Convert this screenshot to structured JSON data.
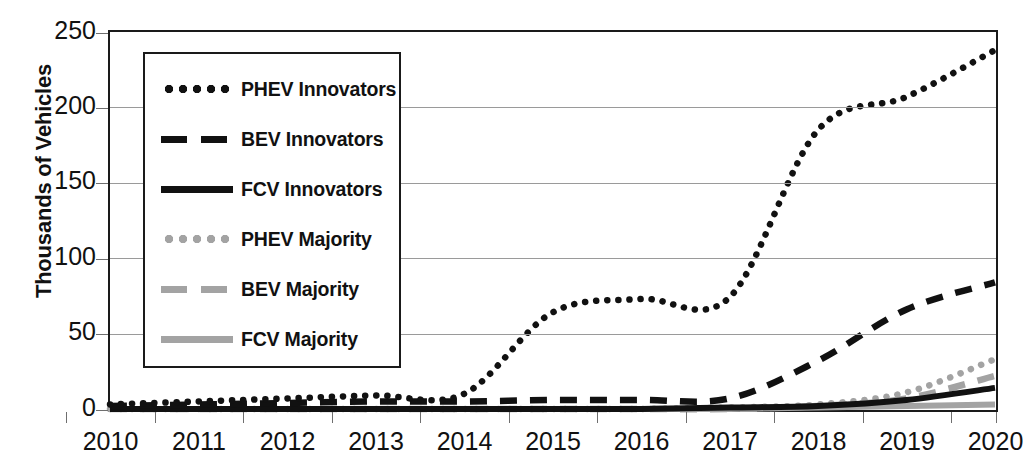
{
  "chart_data": {
    "type": "line",
    "title": "",
    "xlabel": "",
    "ylabel": "Thousands of Vehicles",
    "xlim": [
      2009.5,
      2020.5
    ],
    "ylim": [
      0,
      250
    ],
    "yticks": [
      0,
      50,
      100,
      150,
      200,
      250
    ],
    "grid": "horizontal",
    "legend_position": "upper-left-inside",
    "categories": [
      "2010",
      "2011",
      "2012",
      "2013",
      "2014",
      "2015",
      "2016",
      "2017",
      "2018",
      "2019",
      "2020"
    ],
    "x": [
      2010,
      2011,
      2012,
      2013,
      2014,
      2015,
      2016,
      2017,
      2018,
      2019,
      2020
    ],
    "series": [
      {
        "name": "PHEV Innovators",
        "style": "dotted",
        "color": "#111111",
        "values": [
          3,
          5,
          7,
          9,
          10,
          64,
          73,
          74,
          185,
          207,
          238
        ]
      },
      {
        "name": "BEV Innovators",
        "style": "dashed",
        "color": "#111111",
        "values": [
          2,
          3,
          4,
          5,
          5,
          6,
          6,
          7,
          32,
          66,
          84
        ]
      },
      {
        "name": "FCV Innovators",
        "style": "solid",
        "color": "#111111",
        "values": [
          0,
          0,
          0,
          0,
          0,
          0,
          0,
          1,
          2,
          6,
          14
        ]
      },
      {
        "name": "PHEV Majority",
        "style": "dotted",
        "color": "#a3a3a3",
        "values": [
          0,
          0,
          0,
          0,
          0,
          0,
          0,
          1,
          3,
          11,
          33
        ]
      },
      {
        "name": "BEV Majority",
        "style": "dashed",
        "color": "#a3a3a3",
        "values": [
          0,
          0,
          0,
          0,
          0,
          0,
          0,
          0,
          2,
          7,
          22
        ]
      },
      {
        "name": "FCV Majority",
        "style": "solid",
        "color": "#a3a3a3",
        "values": [
          0,
          0,
          0,
          0,
          0,
          0,
          0,
          0,
          1,
          2,
          3
        ]
      }
    ]
  },
  "axes": {
    "y_title": "Thousands of Vehicles",
    "y_tick_labels": [
      "250",
      "200",
      "150",
      "100",
      "50",
      "0"
    ],
    "x_tick_labels": [
      "2010",
      "2011",
      "2012",
      "2013",
      "2014",
      "2015",
      "2016",
      "2017",
      "2018",
      "2019",
      "2020"
    ]
  },
  "legend": {
    "items": [
      {
        "label": "PHEV Innovators",
        "swatch": "dotted-dark"
      },
      {
        "label": "BEV Innovators",
        "swatch": "dashed-dark"
      },
      {
        "label": "FCV Innovators",
        "swatch": "solid-dark"
      },
      {
        "label": "PHEV Majority",
        "swatch": "dotted-gray"
      },
      {
        "label": "BEV Majority",
        "swatch": "dashed-gray"
      },
      {
        "label": "FCV Majority",
        "swatch": "solid-gray"
      }
    ]
  },
  "colors": {
    "innovators": "#111111",
    "majority": "#a3a3a3",
    "grid": "#9a9a9a",
    "frame": "#1a1a1a"
  }
}
